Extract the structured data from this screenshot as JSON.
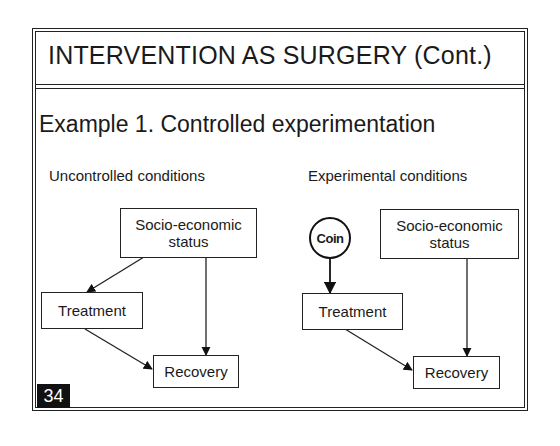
{
  "slide": {
    "title": "INTERVENTION AS SURGERY (Cont.)",
    "subtitle": "Example 1.  Controlled experimentation",
    "page_number": "34"
  },
  "left_panel": {
    "label": "Uncontrolled conditions",
    "nodes": {
      "ses_line1": "Socio-economic",
      "ses_line2": "status",
      "treatment": "Treatment",
      "recovery": "Recovery"
    },
    "edges": [
      {
        "from": "Socio-economic status",
        "to": "Treatment"
      },
      {
        "from": "Socio-economic status",
        "to": "Recovery"
      },
      {
        "from": "Treatment",
        "to": "Recovery"
      }
    ]
  },
  "right_panel": {
    "label": "Experimental conditions",
    "nodes": {
      "coin": "Coin",
      "ses_line1": "Socio-economic",
      "ses_line2": "status",
      "treatment": "Treatment",
      "recovery": "Recovery"
    },
    "edges": [
      {
        "from": "Coin",
        "to": "Treatment"
      },
      {
        "from": "Socio-economic status",
        "to": "Recovery"
      },
      {
        "from": "Treatment",
        "to": "Recovery"
      }
    ]
  }
}
